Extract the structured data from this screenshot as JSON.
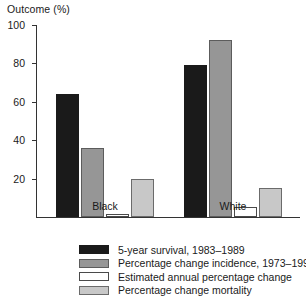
{
  "chart_data": {
    "type": "bar",
    "title": "",
    "xlabel": "",
    "ylabel": "Outcome (%)",
    "ylim": [
      0,
      100
    ],
    "yticks": [
      20,
      40,
      60,
      80,
      100
    ],
    "ytick_labels": [
      "20",
      "40",
      "60",
      "80",
      "100"
    ],
    "grid": false,
    "legend_position": "bottom",
    "categories": [
      "Black",
      "White"
    ],
    "series": [
      {
        "name": "5-year survival, 1983–1989",
        "color": "#1a1a1a",
        "values": [
          64,
          79
        ]
      },
      {
        "name": "Percentage change incidence, 1973–1990",
        "color": "#969696",
        "values": [
          36,
          92
        ]
      },
      {
        "name": "Estimated annual percentage change",
        "color": "#ffffff",
        "values": [
          1.5,
          5
        ]
      },
      {
        "name": "Percentage change mortality",
        "color": "#c8c8c8",
        "values": [
          20,
          15
        ]
      }
    ]
  }
}
